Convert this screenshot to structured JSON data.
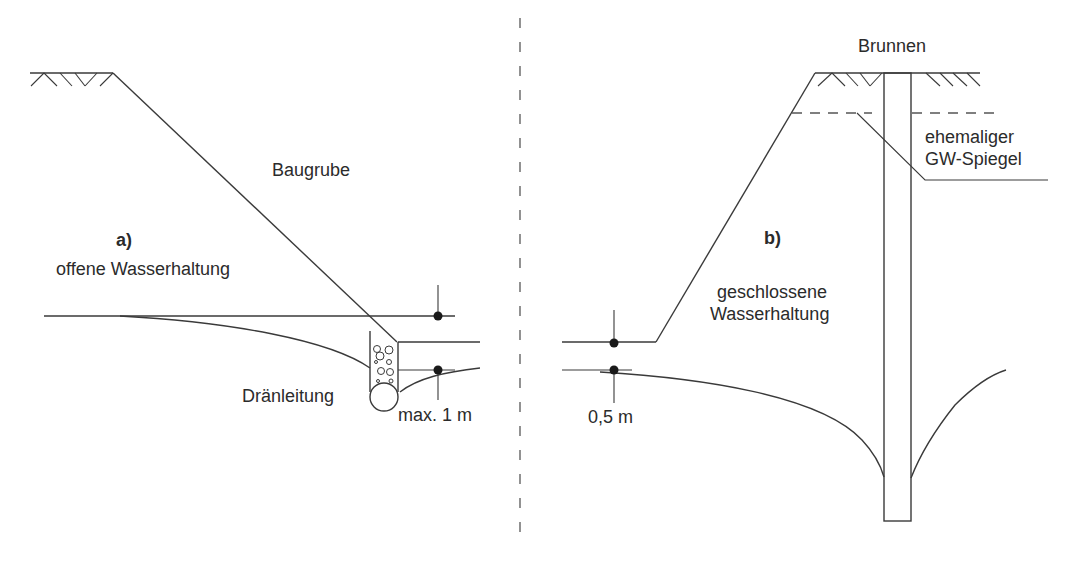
{
  "figure": {
    "panel_a": {
      "marker": "a)",
      "title": "offene Wasserhaltung",
      "excavation_label": "Baugrube",
      "drain_label": "Dränleitung",
      "dimension_label": "max. 1 m"
    },
    "panel_b": {
      "marker": "b)",
      "title_line1": "geschlossene",
      "title_line2": "Wasserhaltung",
      "well_label": "Brunnen",
      "former_gw_line1": "ehemaliger",
      "former_gw_line2": "GW-Spiegel",
      "dimension_label": "0,5 m"
    },
    "colors": {
      "line": "#3a3a3a",
      "text": "#2b2b2b",
      "divider": "#777777",
      "background": "#ffffff"
    }
  }
}
